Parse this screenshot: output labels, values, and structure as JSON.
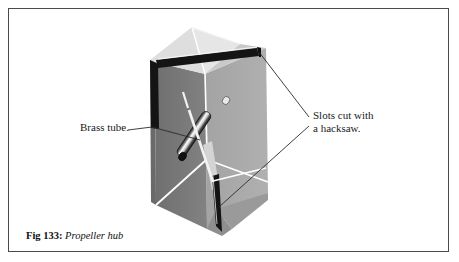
{
  "figure": {
    "caption_number": "Fig 133:",
    "caption_title": "Propeller hub",
    "border_color": "#4a4a4a",
    "background_color": "#ffffff"
  },
  "labels": {
    "brass_tube": "Brass tube.",
    "slots_line1": "Slots cut with",
    "slots_line2": "a hacksaw."
  },
  "illustration": {
    "subject": "propeller-hub-block",
    "colors": {
      "face_left_dark": "#787878",
      "face_right_light": "#a8a8a8",
      "face_front_mid": "#8e8e8e",
      "top_facet_light": "#d9d9d9",
      "top_facet_lighter": "#c6c6c6",
      "top_facet_pale": "#e4e4e4",
      "slot_black": "#141414",
      "highlight_white": "#ffffff",
      "tube_dark": "#1f1f1f",
      "tube_light": "#f2f2f2",
      "tube_mid": "#9a9a9a",
      "leader_line": "#2a2a2a"
    },
    "parts": [
      "block-body",
      "top-facets",
      "top-slot",
      "bottom-slot",
      "brass-tube",
      "leader-line-brass-tube",
      "leader-line-slot-top",
      "leader-line-slot-bottom"
    ]
  }
}
